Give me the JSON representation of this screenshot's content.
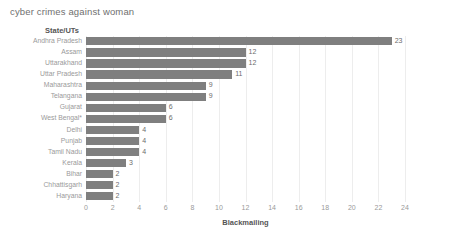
{
  "chart_data": {
    "type": "bar",
    "orientation": "horizontal",
    "title": "cyber crimes against woman",
    "xlabel": "Blackmailing",
    "ylabel": "State/UTs",
    "xlim": [
      0,
      24
    ],
    "xticks": [
      0,
      2,
      4,
      6,
      8,
      10,
      12,
      14,
      16,
      18,
      20,
      22,
      24
    ],
    "grid": true,
    "legend": null,
    "bar_color": "#7f7f7f",
    "categories": [
      "Andhra Pradesh",
      "Assam",
      "Uttarakhand",
      "Uttar Pradesh",
      "Maharashtra",
      "Telangana",
      "Gujarat",
      "West Bengal*",
      "Delhi",
      "Punjab",
      "Tamil Nadu",
      "Kerala",
      "Bihar",
      "Chhattisgarh",
      "Haryana"
    ],
    "values": [
      23,
      12,
      12,
      11,
      9,
      9,
      6,
      6,
      4,
      4,
      4,
      3,
      2,
      2,
      2
    ],
    "value_labels": [
      "23",
      "12",
      "12",
      "11",
      "9",
      "9",
      "6",
      "6",
      "4",
      "4",
      "4",
      "3",
      "2",
      "2",
      "2"
    ]
  }
}
